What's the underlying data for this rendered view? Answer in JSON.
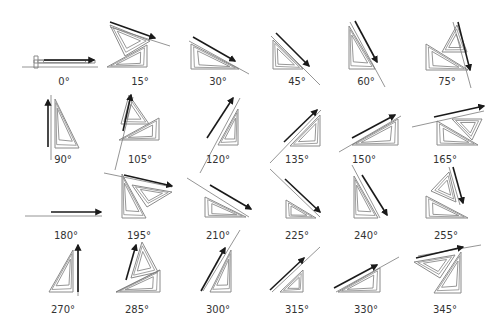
{
  "colors": {
    "outline": "#8a8a8a",
    "guide": "#7a7a7a",
    "arrow": "#1a1a1a",
    "label": "#333333"
  },
  "figures": [
    {
      "label": "0°",
      "lx": 64,
      "ly": 76,
      "tri": [
        [
          [
            34,
            60
          ],
          [
            95,
            60
          ],
          [
            95,
            63
          ],
          [
            34,
            63
          ]
        ]
      ],
      "guide": [
        [
          22,
          67
        ],
        [
          98,
          67
        ]
      ],
      "stub": [
        [
          34,
          56
        ],
        [
          38,
          56
        ],
        [
          38,
          68
        ],
        [
          34,
          68
        ]
      ],
      "arrow": [
        [
          44,
          60
        ],
        [
          94,
          60
        ]
      ]
    },
    {
      "label": "15°",
      "lx": 140,
      "ly": 76,
      "tri": [
        [
          [
            107,
            67
          ],
          [
            147,
            67
          ],
          [
            147,
            45
          ]
        ],
        [
          [
            110,
            25
          ],
          [
            150,
            41
          ],
          [
            125,
            56
          ]
        ]
      ],
      "guide": [
        [
          110,
          27
        ],
        [
          170,
          46
        ]
      ],
      "arrow": [
        [
          110,
          22
        ],
        [
          155,
          38
        ]
      ]
    },
    {
      "label": "30°",
      "lx": 218,
      "ly": 76,
      "tri": [
        [
          [
            191,
            69
          ],
          [
            239,
            69
          ],
          [
            191,
            44
          ]
        ]
      ],
      "guide": [
        [
          189,
          41
        ],
        [
          249,
          74
        ]
      ],
      "arrow": [
        [
          193,
          37
        ],
        [
          235,
          61
        ]
      ]
    },
    {
      "label": "45°",
      "lx": 297,
      "ly": 76,
      "tri": [
        [
          [
            273,
            69
          ],
          [
            303,
            69
          ],
          [
            273,
            40
          ]
        ]
      ],
      "guide": [
        [
          271,
          36
        ],
        [
          320,
          85
        ]
      ],
      "arrow": [
        [
          276,
          33
        ],
        [
          309,
          66
        ]
      ]
    },
    {
      "label": "60°",
      "lx": 366,
      "ly": 76,
      "tri": [
        [
          [
            349,
            69
          ],
          [
            375,
            69
          ],
          [
            349,
            26
          ]
        ]
      ],
      "guide": [
        [
          350,
          22
        ],
        [
          385,
          87
        ]
      ],
      "arrow": [
        [
          355,
          21
        ],
        [
          377,
          62
        ]
      ]
    },
    {
      "label": "75°",
      "lx": 447,
      "ly": 76,
      "tri": [
        [
          [
            426,
            44
          ],
          [
            468,
            70
          ],
          [
            426,
            70
          ]
        ],
        [
          [
            442,
            52
          ],
          [
            467,
            52
          ],
          [
            457,
            25
          ]
        ]
      ],
      "guide": [
        [
          453,
          22
        ],
        [
          471,
          88
        ]
      ],
      "arrow": [
        [
          458,
          22
        ],
        [
          470,
          70
        ]
      ]
    },
    {
      "label": "90°",
      "lx": 63,
      "ly": 154,
      "tri": [
        [
          [
            55,
            99
          ],
          [
            55,
            148
          ],
          [
            79,
            148
          ]
        ]
      ],
      "guide": [
        [
          51,
          95
        ],
        [
          51,
          160
        ]
      ],
      "arrow": [
        [
          48,
          147
        ],
        [
          48,
          100
        ]
      ]
    },
    {
      "label": "105°",
      "lx": 140,
      "ly": 154,
      "tri": [
        [
          [
            119,
            140
          ],
          [
            159,
            118
          ],
          [
            159,
            140
          ]
        ],
        [
          [
            121,
            124
          ],
          [
            129,
            95
          ],
          [
            149,
            124
          ]
        ]
      ],
      "guide": [
        [
          115,
          170
        ],
        [
          133,
          97
        ]
      ],
      "arrow": [
        [
          123,
          131
        ],
        [
          131,
          95
        ]
      ]
    },
    {
      "label": "120°",
      "lx": 218,
      "ly": 154,
      "tri": [
        [
          [
            218,
            145
          ],
          [
            238,
            145
          ],
          [
            238,
            109
          ]
        ]
      ],
      "guide": [
        [
          200,
          173
        ],
        [
          240,
          98
        ]
      ],
      "arrow": [
        [
          207,
          138
        ],
        [
          233,
          98
        ]
      ]
    },
    {
      "label": "135°",
      "lx": 297,
      "ly": 154,
      "tri": [
        [
          [
            290,
            146
          ],
          [
            320,
            146
          ],
          [
            320,
            115
          ]
        ]
      ],
      "guide": [
        [
          270,
          163
        ],
        [
          321,
          110
        ]
      ],
      "arrow": [
        [
          284,
          142
        ],
        [
          317,
          110
        ]
      ]
    },
    {
      "label": "150°",
      "lx": 364,
      "ly": 154,
      "tri": [
        [
          [
            352,
            145
          ],
          [
            398,
            145
          ],
          [
            398,
            119
          ]
        ]
      ],
      "guide": [
        [
          339,
          152
        ],
        [
          401,
          116
        ]
      ],
      "arrow": [
        [
          352,
          138
        ],
        [
          395,
          115
        ]
      ]
    },
    {
      "label": "165°",
      "lx": 445,
      "ly": 154,
      "tri": [
        [
          [
            437,
            121
          ],
          [
            478,
            145
          ],
          [
            437,
            145
          ]
        ],
        [
          [
            452,
            119
          ],
          [
            482,
            119
          ],
          [
            472,
            140
          ]
        ]
      ],
      "guide": [
        [
          412,
          127
        ],
        [
          484,
          111
        ]
      ],
      "arrow": [
        [
          434,
          117
        ],
        [
          484,
          106
        ]
      ]
    },
    {
      "label": "180°",
      "lx": 66,
      "ly": 230,
      "tri": [],
      "guide": [
        [
          25,
          216
        ],
        [
          102,
          216
        ]
      ],
      "arrow": [
        [
          51,
          212
        ],
        [
          101,
          212
        ]
      ]
    },
    {
      "label": "195°",
      "lx": 139,
      "ly": 230,
      "tri": [
        [
          [
            122,
            174
          ],
          [
            122,
            218
          ],
          [
            146,
            218
          ]
        ],
        [
          [
            132,
            185
          ],
          [
            172,
            192
          ],
          [
            147,
            207
          ]
        ]
      ],
      "guide": [
        [
          104,
          173
        ],
        [
          172,
          187
        ]
      ],
      "arrow": [
        [
          124,
          175
        ],
        [
          172,
          186
        ]
      ]
    },
    {
      "label": "210°",
      "lx": 218,
      "ly": 230,
      "tri": [
        [
          [
            205,
            197
          ],
          [
            205,
            217
          ],
          [
            246,
            217
          ]
        ]
      ],
      "guide": [
        [
          187,
          178
        ],
        [
          249,
          217
        ]
      ],
      "arrow": [
        [
          210,
          185
        ],
        [
          251,
          209
        ]
      ]
    },
    {
      "label": "225°",
      "lx": 297,
      "ly": 230,
      "tri": [
        [
          [
            286,
            200
          ],
          [
            286,
            218
          ],
          [
            316,
            218
          ]
        ]
      ],
      "guide": [
        [
          270,
          169
        ],
        [
          320,
          217
        ]
      ],
      "arrow": [
        [
          285,
          179
        ],
        [
          320,
          212
        ]
      ]
    },
    {
      "label": "240°",
      "lx": 366,
      "ly": 230,
      "tri": [
        [
          [
            354,
            176
          ],
          [
            354,
            218
          ],
          [
            378,
            218
          ]
        ]
      ],
      "guide": [
        [
          352,
          165
        ],
        [
          380,
          218
        ]
      ],
      "arrow": [
        [
          362,
          175
        ],
        [
          387,
          215
        ]
      ]
    },
    {
      "label": "255°",
      "lx": 446,
      "ly": 230,
      "tri": [
        [
          [
            426,
            196
          ],
          [
            426,
            218
          ],
          [
            468,
            218
          ]
        ],
        [
          [
            431,
            191
          ],
          [
            449,
            172
          ],
          [
            456,
            202
          ]
        ]
      ],
      "guide": [
        [
          449,
          167
        ],
        [
          460,
          205
        ]
      ],
      "arrow": [
        [
          453,
          167
        ],
        [
          463,
          203
        ]
      ]
    },
    {
      "label": "270°",
      "lx": 63,
      "ly": 304,
      "tri": [
        [
          [
            49,
            292
          ],
          [
            73,
            292
          ],
          [
            73,
            250
          ]
        ]
      ],
      "guide": [
        [
          78,
          296
        ],
        [
          78,
          250
        ]
      ],
      "arrow": [
        [
          78,
          292
        ],
        [
          78,
          245
        ]
      ]
    },
    {
      "label": "285°",
      "lx": 137,
      "ly": 304,
      "tri": [
        [
          [
            116,
            292
          ],
          [
            160,
            270
          ],
          [
            160,
            292
          ]
        ],
        [
          [
            131,
            278
          ],
          [
            142,
            242
          ],
          [
            158,
            272
          ]
        ]
      ],
      "guide": [
        [
          116,
          292
        ],
        [
          160,
          270
        ]
      ],
      "arrow": [
        [
          126,
          280
        ],
        [
          136,
          245
        ]
      ]
    },
    {
      "label": "300°",
      "lx": 218,
      "ly": 304,
      "tri": [
        [
          [
            210,
            292
          ],
          [
            231,
            292
          ],
          [
            231,
            250
          ]
        ]
      ],
      "guide": [
        [
          203,
          291
        ],
        [
          240,
          230
        ]
      ],
      "arrow": [
        [
          201,
          291
        ],
        [
          225,
          248
        ]
      ]
    },
    {
      "label": "315°",
      "lx": 297,
      "ly": 304,
      "tri": [
        [
          [
            280,
            292
          ],
          [
            303,
            292
          ],
          [
            303,
            270
          ]
        ]
      ],
      "guide": [
        [
          272,
          292
        ],
        [
          320,
          247
        ]
      ],
      "arrow": [
        [
          270,
          290
        ],
        [
          304,
          258
        ]
      ]
    },
    {
      "label": "330°",
      "lx": 366,
      "ly": 304,
      "tri": [
        [
          [
            338,
            292
          ],
          [
            380,
            292
          ],
          [
            380,
            268
          ]
        ]
      ],
      "guide": [
        [
          336,
          292
        ],
        [
          399,
          257
        ]
      ],
      "arrow": [
        [
          334,
          288
        ],
        [
          377,
          265
        ]
      ]
    },
    {
      "label": "345°",
      "lx": 445,
      "ly": 304,
      "tri": [
        [
          [
            434,
            293
          ],
          [
            461,
            293
          ],
          [
            461,
            252
          ]
        ],
        [
          [
            414,
            262
          ],
          [
            455,
            255
          ],
          [
            440,
            278
          ]
        ]
      ],
      "guide": [
        [
          418,
          256
        ],
        [
          481,
          245
        ]
      ],
      "arrow": [
        [
          416,
          258
        ],
        [
          463,
          247
        ]
      ]
    }
  ]
}
